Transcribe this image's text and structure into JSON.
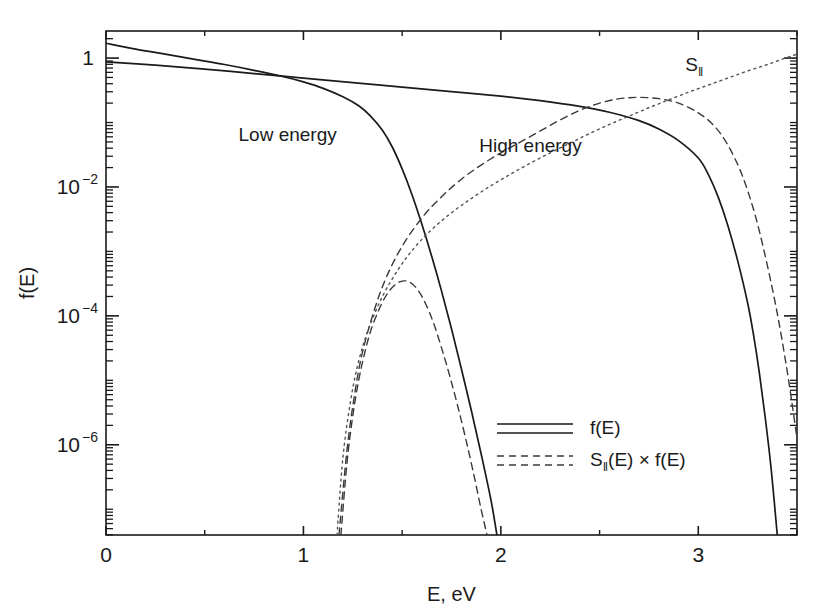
{
  "chart_data": {
    "type": "line",
    "title": "",
    "xlabel": "E, eV",
    "ylabel": "f(E)",
    "xlim": [
      0,
      3.5
    ],
    "ylim_log10": [
      -7.4,
      0.42
    ],
    "yscale": "log",
    "xscale": "linear",
    "grid": false,
    "legend_position": "inside-lower-right",
    "x_ticks_major": [
      0,
      1,
      2,
      3
    ],
    "x_tick_labels": [
      "0",
      "1",
      "2",
      "3"
    ],
    "x_ticks_minor": [
      0.5,
      1.5,
      2.5,
      3.5
    ],
    "y_ticks_major_log10": [
      0,
      -2,
      -4,
      -6
    ],
    "y_tick_labels": [
      "1",
      "10",
      "10",
      "10"
    ],
    "y_tick_exponents": [
      "",
      "−2",
      "−4",
      "−6"
    ],
    "annotations": [
      {
        "text": "Low energy",
        "x": 0.92,
        "y_log10": -1.28
      },
      {
        "text": "High energy",
        "x": 2.15,
        "y_log10": -1.45
      },
      {
        "text": "S",
        "sub": "‖",
        "x": 2.98,
        "y_log10": -0.2
      }
    ],
    "legend": [
      {
        "label": "f(E)",
        "style": "solid",
        "count": 2
      },
      {
        "label": "S‖(E) × f(E)",
        "style": "dashed",
        "count": 2
      }
    ],
    "series": [
      {
        "name": "f(E) low energy",
        "style": "solid",
        "points": [
          [
            0.0,
            0.23
          ],
          [
            0.15,
            0.14
          ],
          [
            0.3,
            0.06
          ],
          [
            0.45,
            -0.02
          ],
          [
            0.6,
            -0.1
          ],
          [
            0.75,
            -0.19
          ],
          [
            0.9,
            -0.29
          ],
          [
            1.0,
            -0.37
          ],
          [
            1.1,
            -0.47
          ],
          [
            1.2,
            -0.6
          ],
          [
            1.28,
            -0.74
          ],
          [
            1.34,
            -0.9
          ],
          [
            1.4,
            -1.12
          ],
          [
            1.45,
            -1.38
          ],
          [
            1.5,
            -1.72
          ],
          [
            1.55,
            -2.12
          ],
          [
            1.6,
            -2.58
          ],
          [
            1.65,
            -3.08
          ],
          [
            1.7,
            -3.62
          ],
          [
            1.75,
            -4.2
          ],
          [
            1.8,
            -4.82
          ],
          [
            1.85,
            -5.46
          ],
          [
            1.9,
            -6.14
          ],
          [
            1.95,
            -6.86
          ],
          [
            1.98,
            -7.4
          ]
        ]
      },
      {
        "name": "f(E) high energy",
        "style": "solid",
        "points": [
          [
            0.0,
            -0.06
          ],
          [
            0.25,
            -0.11
          ],
          [
            0.5,
            -0.17
          ],
          [
            0.75,
            -0.24
          ],
          [
            1.0,
            -0.31
          ],
          [
            1.25,
            -0.38
          ],
          [
            1.5,
            -0.45
          ],
          [
            1.75,
            -0.52
          ],
          [
            2.0,
            -0.59
          ],
          [
            2.2,
            -0.66
          ],
          [
            2.4,
            -0.75
          ],
          [
            2.55,
            -0.84
          ],
          [
            2.7,
            -0.97
          ],
          [
            2.8,
            -1.1
          ],
          [
            2.9,
            -1.28
          ],
          [
            3.0,
            -1.55
          ],
          [
            3.05,
            -1.8
          ],
          [
            3.1,
            -2.15
          ],
          [
            3.15,
            -2.6
          ],
          [
            3.2,
            -3.15
          ],
          [
            3.25,
            -3.8
          ],
          [
            3.28,
            -4.3
          ],
          [
            3.31,
            -4.9
          ],
          [
            3.34,
            -5.6
          ],
          [
            3.37,
            -6.4
          ],
          [
            3.4,
            -7.4
          ]
        ]
      },
      {
        "name": "S(E) x f(E) low energy",
        "style": "dashed",
        "points": [
          [
            1.19,
            -7.4
          ],
          [
            1.22,
            -6.3
          ],
          [
            1.25,
            -5.55
          ],
          [
            1.28,
            -5.0
          ],
          [
            1.31,
            -4.58
          ],
          [
            1.34,
            -4.24
          ],
          [
            1.38,
            -3.92
          ],
          [
            1.42,
            -3.68
          ],
          [
            1.46,
            -3.53
          ],
          [
            1.5,
            -3.46
          ],
          [
            1.54,
            -3.48
          ],
          [
            1.58,
            -3.6
          ],
          [
            1.62,
            -3.82
          ],
          [
            1.66,
            -4.12
          ],
          [
            1.7,
            -4.5
          ],
          [
            1.74,
            -4.92
          ],
          [
            1.78,
            -5.38
          ],
          [
            1.82,
            -5.88
          ],
          [
            1.86,
            -6.42
          ],
          [
            1.9,
            -7.0
          ],
          [
            1.93,
            -7.4
          ]
        ]
      },
      {
        "name": "S(E) x f(E) high energy",
        "style": "dashed",
        "points": [
          [
            1.18,
            -7.4
          ],
          [
            1.22,
            -6.1
          ],
          [
            1.26,
            -5.2
          ],
          [
            1.3,
            -4.55
          ],
          [
            1.36,
            -3.9
          ],
          [
            1.42,
            -3.4
          ],
          [
            1.5,
            -2.92
          ],
          [
            1.6,
            -2.48
          ],
          [
            1.7,
            -2.15
          ],
          [
            1.8,
            -1.88
          ],
          [
            1.9,
            -1.66
          ],
          [
            2.0,
            -1.47
          ],
          [
            2.1,
            -1.3
          ],
          [
            2.2,
            -1.13
          ],
          [
            2.3,
            -0.96
          ],
          [
            2.4,
            -0.81
          ],
          [
            2.5,
            -0.7
          ],
          [
            2.6,
            -0.63
          ],
          [
            2.7,
            -0.61
          ],
          [
            2.8,
            -0.63
          ],
          [
            2.9,
            -0.7
          ],
          [
            3.0,
            -0.85
          ],
          [
            3.08,
            -1.05
          ],
          [
            3.15,
            -1.35
          ],
          [
            3.22,
            -1.8
          ],
          [
            3.28,
            -2.35
          ],
          [
            3.33,
            -2.95
          ],
          [
            3.38,
            -3.65
          ],
          [
            3.42,
            -4.3
          ],
          [
            3.46,
            -5.05
          ],
          [
            3.5,
            -5.9
          ]
        ]
      },
      {
        "name": "S(E) parallel",
        "style": "dotted",
        "points": [
          [
            1.17,
            -7.4
          ],
          [
            1.2,
            -6.2
          ],
          [
            1.24,
            -5.3
          ],
          [
            1.28,
            -4.7
          ],
          [
            1.33,
            -4.2
          ],
          [
            1.4,
            -3.7
          ],
          [
            1.48,
            -3.28
          ],
          [
            1.56,
            -2.95
          ],
          [
            1.65,
            -2.66
          ],
          [
            1.75,
            -2.4
          ],
          [
            1.85,
            -2.18
          ],
          [
            1.95,
            -1.98
          ],
          [
            2.05,
            -1.8
          ],
          [
            2.15,
            -1.63
          ],
          [
            2.25,
            -1.47
          ],
          [
            2.35,
            -1.32
          ],
          [
            2.45,
            -1.17
          ],
          [
            2.55,
            -1.03
          ],
          [
            2.65,
            -0.9
          ],
          [
            2.75,
            -0.77
          ],
          [
            2.85,
            -0.65
          ],
          [
            2.95,
            -0.53
          ],
          [
            3.05,
            -0.42
          ],
          [
            3.15,
            -0.31
          ],
          [
            3.25,
            -0.2
          ],
          [
            3.35,
            -0.1
          ],
          [
            3.45,
            0.01
          ],
          [
            3.5,
            0.06
          ]
        ]
      }
    ]
  }
}
